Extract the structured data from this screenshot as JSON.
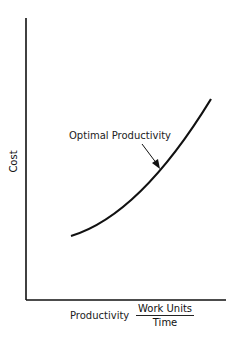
{
  "diagram": {
    "y_axis_label": "Cost",
    "x_axis_label": "Productivity",
    "x_axis_units": {
      "numerator": "Work Units",
      "denominator": "Time"
    },
    "curve_annotation": "Optimal Productivity",
    "curve": {
      "description": "Increasing convex cost curve vs productivity",
      "start": [
        71,
        236
      ],
      "end": [
        211,
        99
      ]
    },
    "colors": {
      "ink": "#111111",
      "background": "#ffffff"
    }
  }
}
